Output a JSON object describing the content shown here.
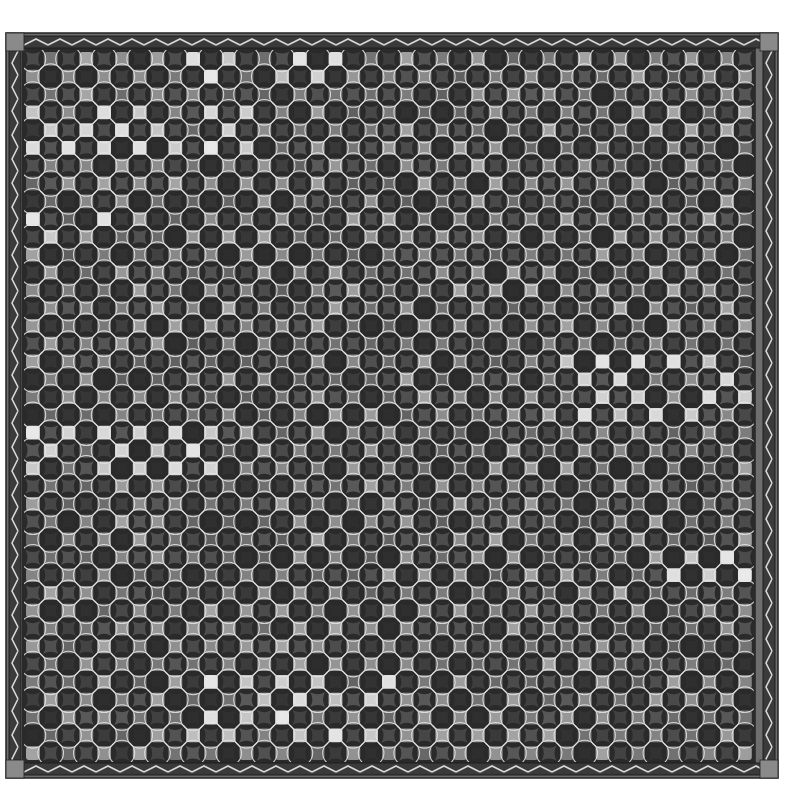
{
  "artwork": {
    "title": "Mosaic tile pattern with decorative border",
    "subject": "Grid of rounded square tiles interlaced with white circles, framed by a chevron-patterned border",
    "frame": {
      "x": 6,
      "y": 33,
      "width": 772,
      "height": 745,
      "band": 18
    },
    "mosaic": {
      "x": 24,
      "y": 50,
      "cols": 41,
      "rows": 40,
      "pitch": 17.8
    },
    "colors": {
      "background": "#ffffff",
      "frame_dark": "#3a3a3a",
      "frame_mid": "#6e6e6e",
      "frame_corner": "#8a8a8a",
      "chevron": "#d8d8d8",
      "grout": "#2a2a2a",
      "circle_line": "#e6e6e6",
      "star_tile": "#3c3c3c",
      "tile_base": "#7a7a7a",
      "tile_light": "#d6d6d6"
    },
    "bright_patches": [
      {
        "c0": 9,
        "c1": 17,
        "r0": 0,
        "r1": 1
      },
      {
        "c0": 0,
        "c1": 12,
        "r0": 3,
        "r1": 5
      },
      {
        "c0": 0,
        "c1": 5,
        "r0": 9,
        "r1": 10
      },
      {
        "c0": 0,
        "c1": 10,
        "r0": 21,
        "r1": 23
      },
      {
        "c0": 30,
        "c1": 40,
        "r0": 17,
        "r1": 20
      },
      {
        "c0": 9,
        "c1": 20,
        "r0": 35,
        "r1": 38
      },
      {
        "c0": 36,
        "c1": 40,
        "r0": 28,
        "r1": 30
      }
    ]
  }
}
